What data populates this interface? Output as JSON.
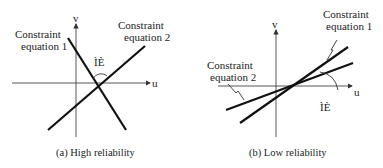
{
  "figures": [
    {
      "id": "a",
      "caption": "(a) High reliability",
      "axis_u": "u",
      "axis_v": "v",
      "line1_label": [
        "Constraint",
        "equation 1"
      ],
      "line2_label": [
        "Constraint",
        "equation 2"
      ],
      "angle_label": "ÌÈ"
    },
    {
      "id": "b",
      "caption": "(b) Low reliability",
      "axis_u": "u",
      "axis_v": "v",
      "line1_label": [
        "Constraint",
        "equation 1"
      ],
      "line2_label": [
        "Constraint",
        "equation 2"
      ],
      "angle_label": "ÌÈ"
    }
  ]
}
